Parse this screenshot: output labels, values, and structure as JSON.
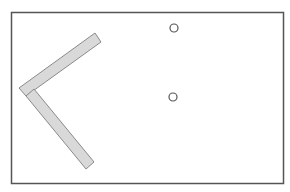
{
  "canvas": {
    "width": 290,
    "height": 192,
    "background": "#ffffff"
  },
  "frame": {
    "x": 11.5,
    "y": 12.5,
    "width": 272,
    "height": 171,
    "stroke": "#555555"
  },
  "bars": [
    {
      "name": "upper-bar",
      "points": "19,88 95,33 101,42 26,96",
      "fill": "#d9d9d9",
      "stroke": "#8a8a8a"
    },
    {
      "name": "lower-bar",
      "points": "26,96 34,89 94,162 86,169",
      "fill": "#d9d9d9",
      "stroke": "#8a8a8a"
    }
  ],
  "circles": [
    {
      "name": "upper-circle",
      "cx": 174,
      "cy": 28,
      "r": 4,
      "stroke": "#555555"
    },
    {
      "name": "lower-circle",
      "cx": 173,
      "cy": 97,
      "r": 4,
      "stroke": "#555555"
    }
  ]
}
